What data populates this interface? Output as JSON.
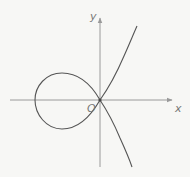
{
  "diagram": {
    "type": "curve-plot",
    "axes": {
      "x_label": "x",
      "y_label": "y",
      "origin_label": "O"
    },
    "colors": {
      "axis": "#9a9a9a",
      "curve": "#555555",
      "labels": "#777777",
      "background": "#f7f7f5"
    }
  }
}
